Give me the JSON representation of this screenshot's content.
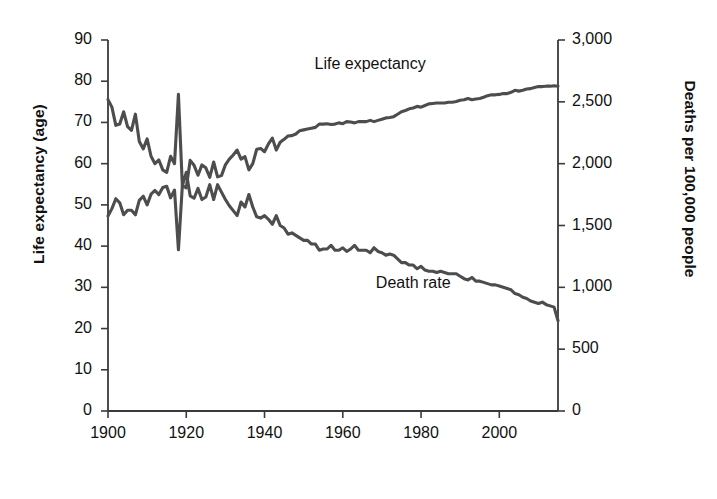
{
  "chart_data": {
    "type": "line",
    "title": "",
    "xlabel": "",
    "ylabel": "Life expectancy (age)",
    "y2label": "Deaths per 100,000 people",
    "xlim": [
      1900,
      2015
    ],
    "ylim": [
      0,
      90
    ],
    "y2lim": [
      0,
      3000
    ],
    "grid": false,
    "legend_position": "inline-annotation",
    "line_color": "#4d4d4d",
    "axis_color": "#3a3a3a",
    "x_ticks": [
      1900,
      1920,
      1940,
      1960,
      1980,
      2000
    ],
    "x_tick_labels": [
      "1900",
      "1920",
      "1940",
      "1960",
      "1980",
      "2000"
    ],
    "y_ticks": [
      0,
      10,
      20,
      30,
      40,
      50,
      60,
      70,
      80,
      90
    ],
    "y_tick_labels": [
      "0",
      "10",
      "20",
      "30",
      "40",
      "50",
      "60",
      "70",
      "80",
      "90"
    ],
    "y2_ticks": [
      0,
      500,
      1000,
      1500,
      2000,
      2500,
      3000
    ],
    "y2_tick_labels": [
      "0",
      "500",
      "1,000",
      "1,500",
      "2,000",
      "2,500",
      "3,000"
    ],
    "annotations": [
      {
        "text": "Life expectancy",
        "x": 1967,
        "y": 84,
        "axis": "left"
      },
      {
        "text": "Death rate",
        "x": 1978,
        "y": 1030,
        "axis": "right"
      }
    ],
    "series": [
      {
        "name": "Life expectancy",
        "axis": "left",
        "unit": "years",
        "x": [
          1900,
          1901,
          1902,
          1903,
          1904,
          1905,
          1906,
          1907,
          1908,
          1909,
          1910,
          1911,
          1912,
          1913,
          1914,
          1915,
          1916,
          1917,
          1918,
          1919,
          1920,
          1921,
          1922,
          1923,
          1924,
          1925,
          1926,
          1927,
          1928,
          1929,
          1930,
          1931,
          1932,
          1933,
          1934,
          1935,
          1936,
          1937,
          1938,
          1939,
          1940,
          1941,
          1942,
          1943,
          1944,
          1945,
          1946,
          1947,
          1948,
          1949,
          1950,
          1951,
          1952,
          1953,
          1954,
          1955,
          1956,
          1957,
          1958,
          1959,
          1960,
          1961,
          1962,
          1963,
          1964,
          1965,
          1966,
          1967,
          1968,
          1969,
          1970,
          1971,
          1972,
          1973,
          1974,
          1975,
          1976,
          1977,
          1978,
          1979,
          1980,
          1981,
          1982,
          1983,
          1984,
          1985,
          1986,
          1987,
          1988,
          1989,
          1990,
          1991,
          1992,
          1993,
          1994,
          1995,
          1996,
          1997,
          1998,
          1999,
          2000,
          2001,
          2002,
          2003,
          2004,
          2005,
          2006,
          2007,
          2008,
          2009,
          2010,
          2011,
          2012,
          2013,
          2014,
          2015
        ],
        "values": [
          47.3,
          49.1,
          51.5,
          50.5,
          47.6,
          48.7,
          48.7,
          47.6,
          51.1,
          52.1,
          50.0,
          52.6,
          53.5,
          52.5,
          54.2,
          54.5,
          51.7,
          53.6,
          39.1,
          54.7,
          54.1,
          60.8,
          59.6,
          57.2,
          59.7,
          59.0,
          56.7,
          60.4,
          56.8,
          57.1,
          59.7,
          61.1,
          62.1,
          63.3,
          61.1,
          61.7,
          58.5,
          60.0,
          63.5,
          63.7,
          62.9,
          64.8,
          66.2,
          63.3,
          65.2,
          65.9,
          66.7,
          66.8,
          67.2,
          68.0,
          68.2,
          68.4,
          68.6,
          68.8,
          69.6,
          69.6,
          69.7,
          69.5,
          69.6,
          69.9,
          69.7,
          70.2,
          70.1,
          69.9,
          70.2,
          70.2,
          70.2,
          70.5,
          70.2,
          70.5,
          70.8,
          71.1,
          71.2,
          71.4,
          72.0,
          72.6,
          72.9,
          73.3,
          73.5,
          73.9,
          73.7,
          74.1,
          74.5,
          74.6,
          74.7,
          74.7,
          74.7,
          74.9,
          74.9,
          75.1,
          75.4,
          75.5,
          75.8,
          75.5,
          75.7,
          75.8,
          76.1,
          76.5,
          76.7,
          76.7,
          76.8,
          77.0,
          77.0,
          77.3,
          77.8,
          77.6,
          77.8,
          78.1,
          78.2,
          78.5,
          78.7,
          78.7,
          78.8,
          78.8,
          78.9,
          78.8
        ]
      },
      {
        "name": "Death rate",
        "axis": "right",
        "unit": "deaths per 100,000",
        "x": [
          1900,
          1901,
          1902,
          1903,
          1904,
          1905,
          1906,
          1907,
          1908,
          1909,
          1910,
          1911,
          1912,
          1913,
          1914,
          1915,
          1916,
          1917,
          1918,
          1919,
          1920,
          1921,
          1922,
          1923,
          1924,
          1925,
          1926,
          1927,
          1928,
          1929,
          1930,
          1931,
          1932,
          1933,
          1934,
          1935,
          1936,
          1937,
          1938,
          1939,
          1940,
          1941,
          1942,
          1943,
          1944,
          1945,
          1946,
          1947,
          1948,
          1949,
          1950,
          1951,
          1952,
          1953,
          1954,
          1955,
          1956,
          1957,
          1958,
          1959,
          1960,
          1961,
          1962,
          1963,
          1964,
          1965,
          1966,
          1967,
          1968,
          1969,
          1970,
          1971,
          1972,
          1973,
          1974,
          1975,
          1976,
          1977,
          1978,
          1979,
          1980,
          1981,
          1982,
          1983,
          1984,
          1985,
          1986,
          1987,
          1988,
          1989,
          1990,
          1991,
          1992,
          1993,
          1994,
          1995,
          1996,
          1997,
          1998,
          1999,
          2000,
          2001,
          2002,
          2003,
          2004,
          2005,
          2006,
          2007,
          2008,
          2009,
          2010,
          2011,
          2012,
          2013,
          2014,
          2015
        ],
        "values": [
          2518,
          2457,
          2310,
          2320,
          2420,
          2300,
          2270,
          2400,
          2180,
          2120,
          2200,
          2060,
          2000,
          2030,
          1950,
          1930,
          2060,
          2000,
          2560,
          1820,
          1930,
          1740,
          1720,
          1800,
          1710,
          1730,
          1830,
          1710,
          1830,
          1770,
          1710,
          1660,
          1620,
          1580,
          1690,
          1650,
          1750,
          1650,
          1570,
          1560,
          1580,
          1550,
          1510,
          1580,
          1500,
          1480,
          1430,
          1440,
          1420,
          1400,
          1380,
          1380,
          1350,
          1350,
          1300,
          1310,
          1310,
          1340,
          1300,
          1300,
          1320,
          1290,
          1310,
          1340,
          1300,
          1300,
          1300,
          1280,
          1320,
          1290,
          1280,
          1260,
          1270,
          1260,
          1230,
          1200,
          1200,
          1180,
          1180,
          1150,
          1170,
          1140,
          1130,
          1130,
          1120,
          1130,
          1120,
          1110,
          1110,
          1110,
          1090,
          1070,
          1060,
          1080,
          1050,
          1050,
          1040,
          1030,
          1020,
          1020,
          1010,
          1000,
          990,
          980,
          950,
          940,
          920,
          910,
          890,
          880,
          870,
          880,
          860,
          850,
          840,
          730
        ]
      }
    ],
    "notable_events": [
      {
        "year": 1918,
        "label": "Influenza pandemic",
        "life_expectancy": 39.1,
        "death_rate": 2560
      }
    ]
  },
  "axes": {
    "left_title": "Life expectancy (age)",
    "right_title": "Deaths per 100,000 people"
  }
}
